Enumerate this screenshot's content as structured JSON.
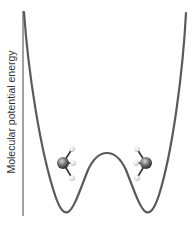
{
  "diagram": {
    "y_axis_label": "Molecular potential energy",
    "curve_description": "symmetric double-well potential",
    "colors": {
      "curve": "#5a5a5a",
      "axis": "#444444",
      "carbon_atom": "#6e6e6e",
      "hydrogen_atom": "#e6e6e6",
      "bond": "#333333"
    },
    "molecules": [
      {
        "name": "left-ammonia-molecule",
        "orientation": "left-facing"
      },
      {
        "name": "right-ammonia-molecule",
        "orientation": "right-facing"
      }
    ]
  }
}
